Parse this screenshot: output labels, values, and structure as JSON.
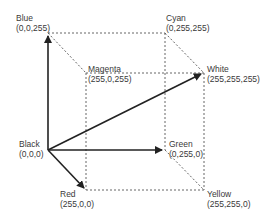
{
  "vertices": {
    "black": {
      "name": "Black",
      "rgb": "(0,0,0)"
    },
    "blue": {
      "name": "Blue",
      "rgb": "(0,0,255)"
    },
    "cyan": {
      "name": "Cyan",
      "rgb": "(0,255,255)"
    },
    "magenta": {
      "name": "Magenta",
      "rgb": "(255,0,255)"
    },
    "white": {
      "name": "White",
      "rgb": "(255,255,255)"
    },
    "green": {
      "name": "Green",
      "rgb": "(0,255,0)"
    },
    "red": {
      "name": "Red",
      "rgb": "(255,0,0)"
    },
    "yellow": {
      "name": "Yellow",
      "rgb": "(255,255,0)"
    }
  },
  "arrows": [
    "Black→Blue",
    "Black→Green",
    "Black→Red",
    "Black→White"
  ],
  "colors": {
    "edge": "#555555",
    "arrow": "#222222",
    "text": "#3a3a3a"
  }
}
